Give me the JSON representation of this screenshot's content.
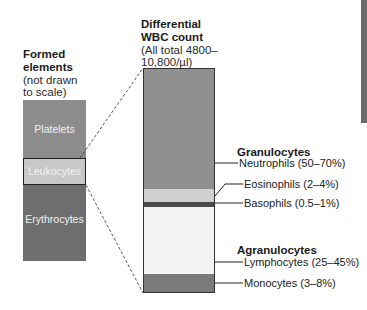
{
  "left": {
    "title_line1": "Formed",
    "title_line2": "elements",
    "subtitle_line1": "(not drawn",
    "subtitle_line2": "to scale)",
    "segments": [
      {
        "label": "Platelets",
        "color": "#8c8c8c"
      },
      {
        "label": "Leukocytes",
        "color": "#c8c8c8"
      },
      {
        "label": "Erythrocytes",
        "color": "#6e6e6e"
      }
    ]
  },
  "right": {
    "title_line1": "Differential",
    "title_line2": "WBC count",
    "subtitle_line1": "(All total 4800–",
    "subtitle_line2": "10,800/µl)",
    "segments": [
      {
        "name": "Neutrophils",
        "color": "#8f8f8f"
      },
      {
        "name": "Eosinophils",
        "color": "#cfcfcf"
      },
      {
        "name": "Basophils",
        "color": "#4a4a4a"
      },
      {
        "name": "Lymphocytes",
        "color": "#f3f3f3"
      },
      {
        "name": "Monocytes",
        "color": "#7a7a7a"
      }
    ]
  },
  "groups": {
    "granulocytes": "Granulocytes",
    "agranulocytes": "Agranulocytes"
  },
  "labels": {
    "neutrophils": "Neutrophils (50–70%)",
    "eosinophils": "Eosinophils (2–4%)",
    "basophils": "Basophils (0.5–1%)",
    "lymphocytes": "Lymphocytes (25–45%)",
    "monocytes": "Monocytes (3–8%)"
  }
}
